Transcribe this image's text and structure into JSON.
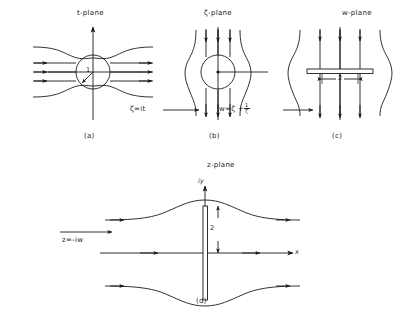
{
  "figure": {
    "caption_panels": [
      "(a)",
      "(b)",
      "(c)",
      "(d)"
    ],
    "panels": [
      {
        "id": "a",
        "title": "t-plane",
        "label": "(a)",
        "body_type": "circle",
        "radius_label": "1",
        "flow_direction": "horizontal",
        "description": "uniform horizontal flow past a unit circle"
      },
      {
        "id": "b",
        "title": "ζ-plane",
        "label": "(b)",
        "body_type": "circle",
        "flow_direction": "vertical",
        "description": "uniform vertical flow past a unit circle"
      },
      {
        "id": "c",
        "title": "w-plane",
        "label": "(c)",
        "body_type": "horizontal-plate",
        "dimension_label": "2",
        "flow_direction": "vertical",
        "description": "vertical flow past a horizontal flat plate of width 2"
      },
      {
        "id": "d",
        "title": "z-plane",
        "label": "(d)",
        "body_type": "vertical-plate",
        "dimension_label": "2",
        "axis_x": "x",
        "axis_y": "iy",
        "flow_direction": "horizontal",
        "description": "horizontal flow past a vertical flat plate"
      }
    ],
    "transformations": [
      {
        "id": "t-to-zeta",
        "text_plain": "ζ = it",
        "lhs": "ζ",
        "eq": "=",
        "rhs": "it"
      },
      {
        "id": "zeta-to-w",
        "text_plain": "w = ζ + 1/ζ",
        "lhs": "w",
        "eq": "=",
        "rhs_head": "ζ +",
        "rhs_frac_num": "1",
        "rhs_frac_den": "ζ"
      },
      {
        "id": "w-to-z",
        "text_plain": "z = -iw",
        "lhs": "z",
        "eq": "=",
        "rhs": "-iw"
      }
    ],
    "colors": {
      "ink": "#1a1a1a",
      "background": "#ffffff"
    }
  }
}
